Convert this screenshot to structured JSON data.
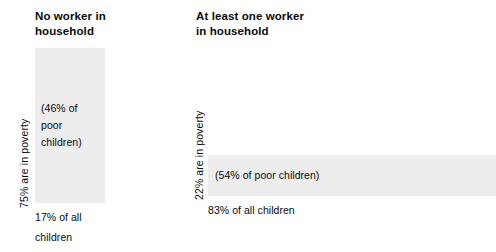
{
  "chart_data": {
    "type": "bar",
    "title": "",
    "subtitle": "",
    "xlabel": "",
    "ylabel": "",
    "grid": false,
    "legend": "none",
    "note": "Two proportional panels: bar height encodes poverty rate, bar width encodes share of all children; bar area encodes share of poor children.",
    "categories": [
      "No worker in household",
      "At least one worker in household"
    ],
    "series": [
      {
        "name": "Percent in poverty",
        "values": [
          75,
          22
        ],
        "unit": "%"
      },
      {
        "name": "Percent of all children",
        "values": [
          17,
          83
        ],
        "unit": "%"
      },
      {
        "name": "Percent of poor children",
        "values": [
          46,
          54
        ],
        "unit": "%"
      }
    ]
  },
  "panels": [
    {
      "heading": "No worker in\nhousehold",
      "axis_label": "75% are in poverty",
      "bar_caption": "(46% of\npoor\nchildren)",
      "footnote": "17% of all\nchildren"
    },
    {
      "heading": "At least one worker\nin household",
      "axis_label": "22% are in poverty",
      "bar_caption": "(54% of poor children)",
      "footnote": "83% of all children"
    }
  ],
  "colors": {
    "background": "#ffffff",
    "bar_fill": "#ededee",
    "text": "#0a0a0a"
  }
}
